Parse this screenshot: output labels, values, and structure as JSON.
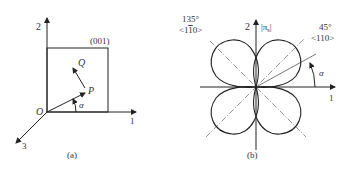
{
  "panel_a": {
    "caption": "(a)",
    "plane_label": "(001)",
    "axis_1": "1",
    "axis_2": "2",
    "axis_3": "3",
    "origin": "O",
    "point_p": "P",
    "point_q": "Q",
    "angle": "α"
  },
  "panel_b": {
    "caption": "(b)",
    "axis_1": "1",
    "axis_2": "2",
    "quantity": "|π",
    "quantity_sub": "s",
    "quantity_end": "|",
    "dir_135_angle": "135°",
    "dir_135_index": "<1",
    "dir_135_bar": "1",
    "dir_135_index_end": "0>",
    "dir_45_angle": "45°",
    "dir_45_index": "<110>",
    "angle": "α"
  },
  "colors": {
    "line": "#222222",
    "dash": "#666666",
    "background": "#ffffff"
  }
}
